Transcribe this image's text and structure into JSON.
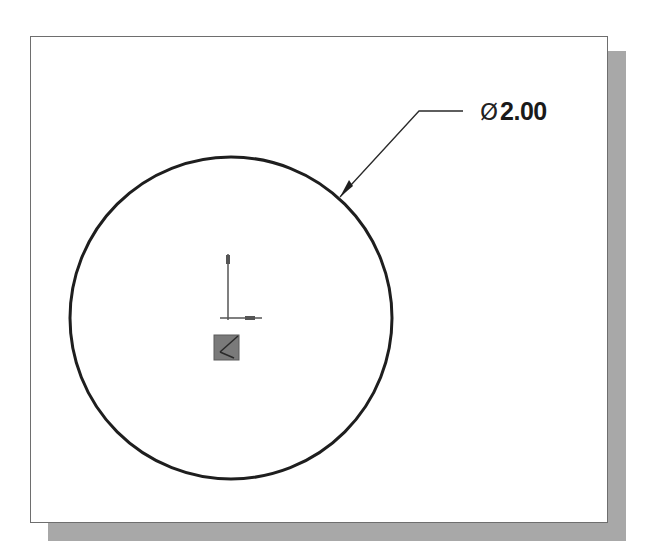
{
  "drawing": {
    "type": "CAD sketch",
    "entities": [
      {
        "kind": "circle",
        "name": "sketch-circle",
        "center": [
          231,
          318
        ],
        "radius": 161
      },
      {
        "kind": "origin-axes",
        "name": "sketch-origin"
      },
      {
        "kind": "fixed-point-marker",
        "name": "origin-point-marker"
      },
      {
        "kind": "diameter-dimension",
        "name": "diameter-dimension"
      }
    ]
  },
  "dimension": {
    "symbol": "Ø",
    "value": "2.00",
    "type": "diameter"
  },
  "colors": {
    "frame_border": "#6e6e6e",
    "shadow": "#a8a8a8",
    "geometry": "#1e1e1e",
    "axes": "#555555",
    "marker_fill": "#7a7a7a"
  }
}
